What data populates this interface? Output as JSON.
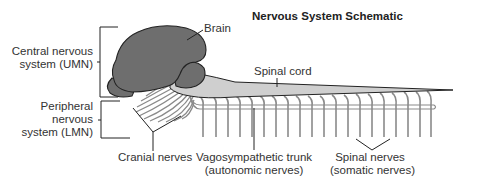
{
  "title": "Nervous System Schematic",
  "labels": {
    "brain": "Brain",
    "spinal_cord": "Spinal cord",
    "cns_line1": "Central nervous",
    "cns_line2": "system (UMN)",
    "pns_line1": "Peripheral",
    "pns_line2": "nervous",
    "pns_line3": "system (LMN)",
    "cranial_nerves": "Cranial nerves",
    "vago_line1": "Vagosympathetic trunk",
    "vago_line2": "(autonomic nerves)",
    "spinal_nerves_line1": "Spinal nerves",
    "spinal_nerves_line2": "(somatic nerves)"
  },
  "colors": {
    "brain_fill": "#6e6e6e",
    "cord_fill": "#cfcfcf",
    "nerve_stroke": "#8a8a8a",
    "outline": "#222222"
  }
}
